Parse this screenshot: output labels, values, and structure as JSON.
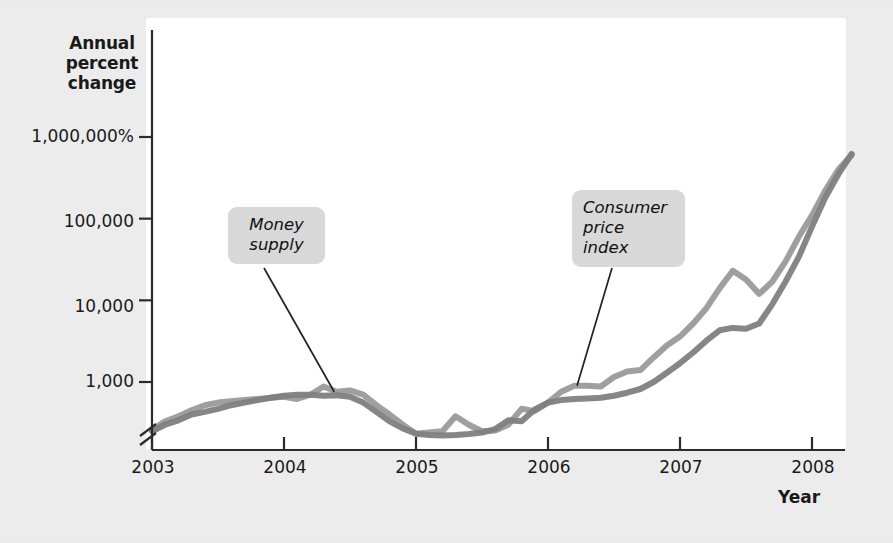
{
  "chart_data": {
    "type": "line",
    "title": "",
    "subtitle": "",
    "xlabel": "Year",
    "ylabel": "Annual percent change",
    "ylabel_lines": [
      "Annual",
      "percent",
      "change"
    ],
    "log_scale": true,
    "axis_break": true,
    "grid": false,
    "legend_position": "inline-callouts",
    "y_tick_labels": [
      "1,000,000%",
      "100,000",
      "10,000",
      "1,000"
    ],
    "y_tick_values": [
      1000000,
      100000,
      10000,
      1000
    ],
    "ylim": [
      200,
      3000000
    ],
    "x_tick_labels": [
      "2003",
      "2004",
      "2005",
      "2006",
      "2007",
      "2008"
    ],
    "x_tick_values": [
      2003,
      2004,
      2005,
      2006,
      2007,
      2008
    ],
    "xlim": [
      2003,
      2008.3
    ],
    "series": [
      {
        "name": "Money supply",
        "color": "#9a9a9a",
        "x": [
          2003.0,
          2003.1,
          2003.2,
          2003.3,
          2003.4,
          2003.5,
          2003.6,
          2003.7,
          2003.8,
          2003.9,
          2004.0,
          2004.1,
          2004.2,
          2004.3,
          2004.4,
          2004.5,
          2004.6,
          2004.7,
          2004.8,
          2004.9,
          2005.0,
          2005.1,
          2005.2,
          2005.3,
          2005.4,
          2005.5,
          2005.6,
          2005.7,
          2005.8,
          2005.9,
          2006.0,
          2006.1,
          2006.2,
          2006.3,
          2006.4,
          2006.5,
          2006.6,
          2006.7,
          2006.8,
          2006.9,
          2007.0,
          2007.1,
          2007.2,
          2007.3,
          2007.4,
          2007.5,
          2007.6,
          2007.7,
          2007.8,
          2007.9,
          2008.0,
          2008.1,
          2008.2,
          2008.3
        ],
        "values": [
          260,
          330,
          380,
          450,
          520,
          560,
          580,
          600,
          620,
          640,
          660,
          620,
          700,
          880,
          760,
          790,
          700,
          520,
          400,
          300,
          232,
          240,
          250,
          380,
          300,
          250,
          255,
          300,
          470,
          440,
          560,
          760,
          900,
          900,
          880,
          1150,
          1350,
          1400,
          2000,
          2800,
          3600,
          5200,
          8000,
          14000,
          23000,
          18000,
          12000,
          17000,
          30000,
          60000,
          110000,
          220000,
          400000,
          600000
        ]
      },
      {
        "name": "Consumer price index",
        "color": "#808080",
        "x": [
          2003.0,
          2003.1,
          2003.2,
          2003.3,
          2003.4,
          2003.5,
          2003.6,
          2003.7,
          2003.8,
          2003.9,
          2004.0,
          2004.1,
          2004.2,
          2004.3,
          2004.4,
          2004.5,
          2004.6,
          2004.7,
          2004.8,
          2004.9,
          2005.0,
          2005.1,
          2005.2,
          2005.3,
          2005.4,
          2005.5,
          2005.6,
          2005.7,
          2005.8,
          2005.9,
          2006.0,
          2006.1,
          2006.2,
          2006.3,
          2006.4,
          2006.5,
          2006.6,
          2006.7,
          2006.8,
          2006.9,
          2007.0,
          2007.1,
          2007.2,
          2007.3,
          2007.4,
          2007.5,
          2007.6,
          2007.7,
          2007.8,
          2007.9,
          2008.0,
          2008.1,
          2008.2,
          2008.3
        ],
        "values": [
          250,
          300,
          340,
          400,
          430,
          470,
          520,
          560,
          600,
          640,
          680,
          700,
          700,
          680,
          690,
          660,
          560,
          430,
          330,
          270,
          232,
          225,
          222,
          225,
          230,
          240,
          265,
          340,
          330,
          460,
          560,
          600,
          620,
          630,
          640,
          680,
          740,
          820,
          1000,
          1300,
          1700,
          2300,
          3200,
          4300,
          4600,
          4500,
          5200,
          9000,
          17000,
          34000,
          80000,
          180000,
          350000,
          620000
        ]
      }
    ],
    "annotations": [
      {
        "name": "money-supply-callout",
        "lines": [
          "Money",
          "supply"
        ],
        "text": "Money supply",
        "leader_from": [
          2004.38,
          760
        ],
        "style": "rounded-gray-box"
      },
      {
        "name": "consumer-price-index-callout",
        "lines": [
          "Consumer",
          "price",
          "index"
        ],
        "text": "Consumer price index",
        "leader_from": [
          2006.22,
          900
        ],
        "style": "rounded-gray-box"
      }
    ]
  },
  "colors": {
    "page_background": "#ececec",
    "plot_background": "#ffffff",
    "axis": "#2b2b2b",
    "text": "#1a1a1a",
    "callout_background": "#d8d8d8",
    "series_money_supply": "#9a9a9a",
    "series_cpi": "#808080",
    "leader_line": "#222222"
  }
}
